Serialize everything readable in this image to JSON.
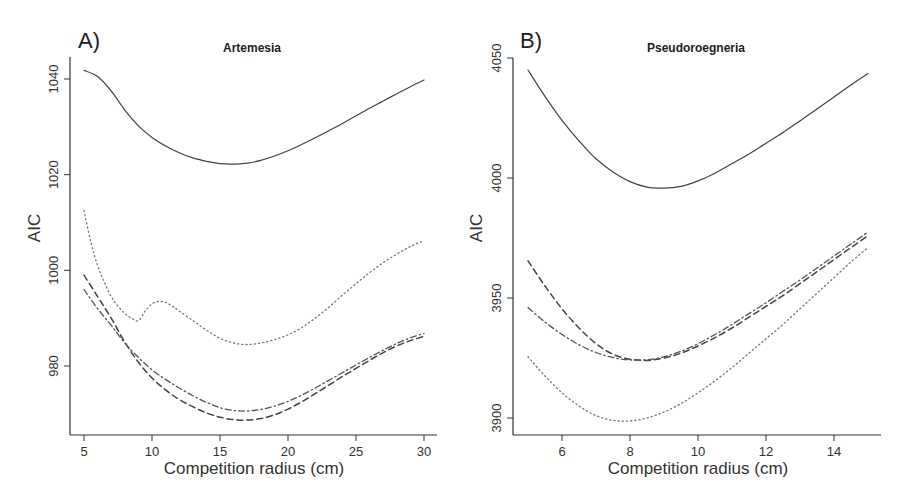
{
  "chart_data": [
    {
      "type": "line",
      "panel_label": "A)",
      "title": "Artemesia",
      "xlabel": "Competition radius (cm)",
      "ylabel": "AIC",
      "xticks": [
        5,
        10,
        15,
        20,
        25,
        30
      ],
      "yticks": [
        980,
        1000,
        1020,
        1040
      ],
      "xlim": [
        4,
        31
      ],
      "ylim": [
        965,
        1043
      ],
      "grid": false,
      "legend": null,
      "series": [
        {
          "name": "solid",
          "style": "solid",
          "x": [
            5,
            6,
            7,
            8,
            9,
            10,
            11,
            12,
            13,
            14,
            15,
            16,
            17,
            18,
            19,
            20,
            21,
            22,
            23,
            24,
            25,
            26,
            27,
            28,
            29,
            30
          ],
          "y": [
            1041.8,
            1040.5,
            1037.5,
            1033.5,
            1030.2,
            1027.8,
            1026.0,
            1024.6,
            1023.5,
            1022.8,
            1022.3,
            1022.2,
            1022.4,
            1023.0,
            1023.9,
            1025.0,
            1026.3,
            1027.7,
            1029.2,
            1030.7,
            1032.3,
            1033.9,
            1035.4,
            1036.9,
            1038.4,
            1039.8
          ]
        },
        {
          "name": "dotted",
          "style": "dotted",
          "x": [
            5,
            5.5,
            6,
            6.5,
            7,
            7.5,
            8,
            8.5,
            9,
            9.5,
            10,
            10.5,
            11,
            11.5,
            12,
            13,
            14,
            15,
            16,
            17,
            18,
            19,
            20,
            21,
            22,
            23,
            24,
            25,
            26,
            27,
            28,
            29,
            30
          ],
          "y": [
            1012.5,
            1006.0,
            1001.0,
            997.5,
            994.5,
            992.5,
            991.0,
            990.0,
            989.5,
            991.5,
            993.0,
            993.5,
            993.3,
            992.5,
            991.5,
            989.5,
            987.5,
            985.8,
            984.8,
            984.5,
            984.8,
            985.5,
            986.5,
            988.0,
            990.0,
            992.3,
            994.8,
            997.2,
            999.5,
            1001.6,
            1003.4,
            1005.0,
            1006.2
          ]
        },
        {
          "name": "dashed",
          "style": "dashed",
          "x": [
            5,
            6,
            7,
            8,
            9,
            10,
            11,
            12,
            13,
            14,
            15,
            16,
            17,
            18,
            19,
            20,
            21,
            22,
            23,
            24,
            25,
            26,
            27,
            28,
            29,
            30
          ],
          "y": [
            999.0,
            994.5,
            990.0,
            985.0,
            980.8,
            977.5,
            975.0,
            973.0,
            971.5,
            970.2,
            969.3,
            968.8,
            968.7,
            969.0,
            969.8,
            971.0,
            972.5,
            974.2,
            976.0,
            977.8,
            979.5,
            981.2,
            982.8,
            984.2,
            985.3,
            986.2
          ]
        },
        {
          "name": "dot-dash",
          "style": "dotdash",
          "x": [
            5,
            6,
            7,
            8,
            9,
            10,
            11,
            12,
            13,
            14,
            15,
            16,
            17,
            18,
            19,
            20,
            21,
            22,
            23,
            24,
            25,
            26,
            27,
            28,
            29,
            30
          ],
          "y": [
            996.0,
            992.0,
            988.5,
            984.8,
            981.8,
            979.2,
            977.2,
            975.4,
            973.8,
            972.4,
            971.3,
            970.7,
            970.6,
            970.9,
            971.6,
            972.6,
            973.9,
            975.4,
            977.0,
            978.6,
            980.2,
            981.8,
            983.3,
            984.7,
            985.9,
            986.8
          ]
        }
      ]
    },
    {
      "type": "line",
      "panel_label": "B)",
      "title": "Pseudoroegneria",
      "xlabel": "Competition radius (cm)",
      "ylabel": "AIC",
      "xticks": [
        6,
        8,
        10,
        12,
        14
      ],
      "yticks": [
        3900,
        3950,
        4000,
        4050
      ],
      "xlim": [
        4.6,
        15.4
      ],
      "ylim": [
        3893,
        4050
      ],
      "grid": false,
      "legend": null,
      "series": [
        {
          "name": "solid",
          "style": "solid",
          "x": [
            5,
            5.5,
            6,
            6.5,
            7,
            7.5,
            8,
            8.5,
            9,
            9.5,
            10,
            10.5,
            11,
            11.5,
            12,
            12.5,
            13,
            13.5,
            14,
            14.5,
            15
          ],
          "y": [
            4045.0,
            4034.0,
            4024.0,
            4015.5,
            4008.0,
            4002.5,
            3998.5,
            3996.2,
            3995.8,
            3996.5,
            3998.8,
            4002.0,
            4006.0,
            4010.0,
            4014.5,
            4019.0,
            4023.8,
            4028.8,
            4033.8,
            4038.8,
            4043.5
          ]
        },
        {
          "name": "dashed",
          "style": "dashed",
          "x": [
            5,
            5.5,
            6,
            6.5,
            7,
            7.5,
            8,
            8.5,
            9,
            9.5,
            10,
            10.5,
            11,
            11.5,
            12,
            12.5,
            13,
            13.5,
            14,
            14.5,
            15
          ],
          "y": [
            3965.5,
            3955.0,
            3945.5,
            3937.5,
            3931.0,
            3926.5,
            3924.5,
            3924.0,
            3925.0,
            3927.0,
            3930.0,
            3933.5,
            3937.5,
            3942.0,
            3946.5,
            3951.0,
            3956.0,
            3961.0,
            3966.0,
            3971.0,
            3976.0
          ]
        },
        {
          "name": "dot-dash",
          "style": "dotdash",
          "x": [
            5,
            5.5,
            6,
            6.5,
            7,
            7.5,
            8,
            8.5,
            9,
            9.5,
            10,
            10.5,
            11,
            11.5,
            12,
            12.5,
            13,
            13.5,
            14,
            14.5,
            15
          ],
          "y": [
            3946.0,
            3940.0,
            3934.8,
            3930.5,
            3927.3,
            3925.2,
            3924.2,
            3924.3,
            3925.5,
            3927.8,
            3931.0,
            3934.8,
            3939.0,
            3943.5,
            3948.0,
            3952.8,
            3957.5,
            3962.5,
            3967.5,
            3972.5,
            3977.5
          ]
        },
        {
          "name": "dotted",
          "style": "dotted",
          "x": [
            5,
            5.5,
            6,
            6.5,
            7,
            7.5,
            8,
            8.5,
            9,
            9.5,
            10,
            10.5,
            11,
            11.5,
            12,
            12.5,
            13,
            13.5,
            14,
            14.5,
            15
          ],
          "y": [
            3925.5,
            3917.5,
            3910.5,
            3905.0,
            3901.0,
            3899.0,
            3898.8,
            3900.0,
            3902.5,
            3906.0,
            3910.5,
            3915.5,
            3921.0,
            3927.0,
            3933.0,
            3939.0,
            3945.5,
            3952.0,
            3958.5,
            3965.0,
            3971.0
          ]
        }
      ]
    }
  ],
  "panels": [
    {
      "letter": "A)",
      "title": "Artemesia",
      "xlabel": "Competition radius (cm)",
      "ylabel": "AIC"
    },
    {
      "letter": "B)",
      "title": "Pseudoroegneria",
      "xlabel": "Competition radius (cm)",
      "ylabel": "AIC"
    }
  ]
}
